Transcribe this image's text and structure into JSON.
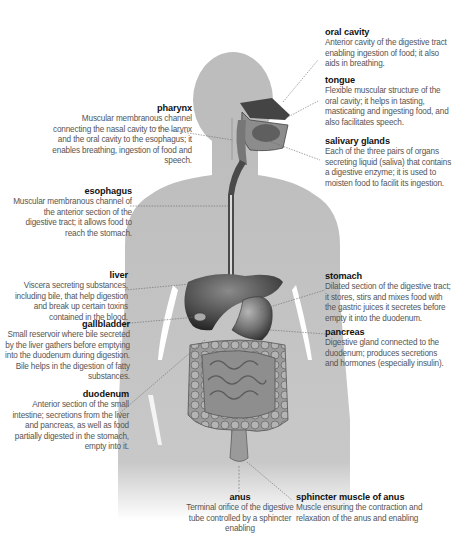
{
  "diagram": {
    "colors": {
      "silhouette": "#bdbdbd",
      "organ_dark": "#3a3a3a",
      "organ_mid": "#7a7a7a",
      "organ_light": "#a8a8a8",
      "leader_line": "#666666",
      "title_text": "#111111",
      "desc_text": "#555555"
    }
  },
  "labels": {
    "oral_cavity": {
      "title": "oral cavity",
      "desc": "Anterior cavity of the digestive tract enabling ingestion of food; it also aids in breathing."
    },
    "tongue": {
      "title": "tongue",
      "desc": "Flexible muscular structure of the oral cavity; it helps in tasting, masticating and ingesting food, and also facilitates speech."
    },
    "salivary_glands": {
      "title": "salivary glands",
      "desc": "Each of the three pairs of organs secreting liquid (saliva) that contains a digestive enzyme; it is used to moisten food to facilit its ingestion."
    },
    "pharynx": {
      "title": "pharynx",
      "desc": "Muscular membranous channel connecting the nasal cavity to the larynx and the oral cavity to the esophagus; it enables breathing, ingestion of food and speech."
    },
    "esophagus": {
      "title": "esophagus",
      "desc": "Muscular membranous channel of the anterior section of the digestive tract; it allows food to reach the stomach."
    },
    "liver": {
      "title": "liver",
      "desc": "Viscera secreting substances, including bile, that help digestion and break up certain toxins contained in the blood."
    },
    "stomach": {
      "title": "stomach",
      "desc": "Dilated section of the digestive tract; it stores, stirs and mixes food with the gastric juices it secretes before empty it into the duodenum."
    },
    "gallbladder": {
      "title": "gallbladder",
      "desc": "Small reservoir where bile secreted by the liver gathers before emptying into the duodenum during digestion. Bile helps in the digestion of fatty substances."
    },
    "pancreas": {
      "title": "pancreas",
      "desc": "Digestive gland connected to the duodenum; produces secretions and hormones (especially insulin)."
    },
    "duodenum": {
      "title": "duodenum",
      "desc": "Anterior section of the small intestine; secretions from the liver and pancreas, as well as food partially digested in the stomach, empty into it."
    },
    "anus": {
      "title": "anus",
      "desc": "Terminal orifice of the digestive tube controlled by a sphincter enabling"
    },
    "sphincter_muscle_of_anus": {
      "title": "sphincter muscle of anus",
      "desc": "Muscle ensuring the contraction and relaxation of the anus and enabling"
    }
  }
}
